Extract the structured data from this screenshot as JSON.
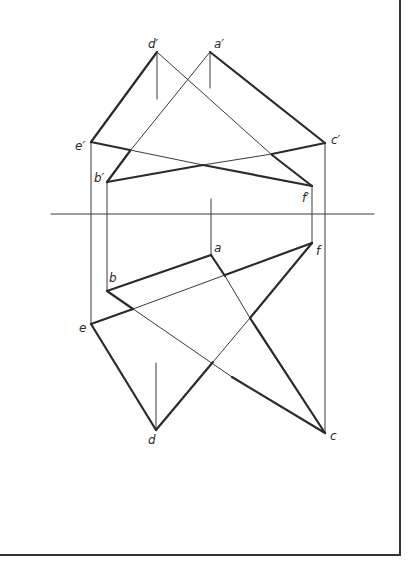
{
  "diagram": {
    "colors": {
      "line": "#2b2b2b",
      "thin": "#3a3a3a",
      "border": "#333333",
      "background": "#ffffff"
    },
    "border": {
      "right_x": 400,
      "bottom_y": 555
    },
    "axis": {
      "x1": 51,
      "x2": 374,
      "y": 214
    },
    "points": {
      "d_prime": {
        "label": "d′",
        "x": 157,
        "y": 52,
        "lx": 148,
        "ly": 38
      },
      "a_prime": {
        "label": "a′",
        "x": 210,
        "y": 52,
        "lx": 214,
        "ly": 38
      },
      "e_prime": {
        "label": "e′",
        "x": 91,
        "y": 142,
        "lx": 75,
        "ly": 140
      },
      "c_prime": {
        "label": "c′",
        "x": 325,
        "y": 143,
        "lx": 331,
        "ly": 134
      },
      "b_prime": {
        "label": "b′",
        "x": 107,
        "y": 182,
        "lx": 94,
        "ly": 172
      },
      "f_prime": {
        "label": "f′",
        "x": 312,
        "y": 186,
        "lx": 302,
        "ly": 192
      },
      "a": {
        "label": "a",
        "x": 211,
        "y": 255,
        "lx": 214,
        "ly": 242
      },
      "f": {
        "label": "f",
        "x": 312,
        "y": 243,
        "lx": 316,
        "ly": 245
      },
      "b": {
        "label": "b",
        "x": 107,
        "y": 291,
        "lx": 109,
        "ly": 272
      },
      "e": {
        "label": "e",
        "x": 91,
        "y": 324,
        "lx": 79,
        "ly": 322
      },
      "d": {
        "label": "d",
        "x": 156,
        "y": 430,
        "lx": 148,
        "ly": 434
      },
      "c": {
        "label": "c",
        "x": 325,
        "y": 433,
        "lx": 330,
        "ly": 430
      }
    },
    "segments": [
      {
        "name": "edge-d'e'",
        "x1": 157,
        "y1": 52,
        "x2": 91,
        "y2": 142,
        "w": 2.2
      },
      {
        "name": "edge-d'f'-thin",
        "x1": 157,
        "y1": 52,
        "x2": 272,
        "y2": 155,
        "w": 1
      },
      {
        "name": "edge-d'f'-thick",
        "x1": 272,
        "y1": 155,
        "x2": 312,
        "y2": 186,
        "w": 2.2
      },
      {
        "name": "edge-e'f'-thick",
        "x1": 91,
        "y1": 142,
        "x2": 130,
        "y2": 150,
        "w": 2.2
      },
      {
        "name": "edge-e'f'-thin",
        "x1": 130,
        "y1": 150,
        "x2": 203,
        "y2": 165,
        "w": 1
      },
      {
        "name": "edge-e'f'-thick2",
        "x1": 203,
        "y1": 165,
        "x2": 312,
        "y2": 186,
        "w": 2.2
      },
      {
        "name": "edge-a'c'",
        "x1": 210,
        "y1": 52,
        "x2": 325,
        "y2": 143,
        "w": 2.2
      },
      {
        "name": "edge-a'b'-thin",
        "x1": 210,
        "y1": 52,
        "x2": 130,
        "y2": 151,
        "w": 1
      },
      {
        "name": "edge-a'b'-thick",
        "x1": 130,
        "y1": 151,
        "x2": 107,
        "y2": 182,
        "w": 2.2
      },
      {
        "name": "edge-b'c'-thick",
        "x1": 107,
        "y1": 182,
        "x2": 203,
        "y2": 165,
        "w": 2.2
      },
      {
        "name": "edge-b'c'-thin",
        "x1": 203,
        "y1": 165,
        "x2": 272,
        "y2": 154,
        "w": 1
      },
      {
        "name": "edge-b'c'-thick2",
        "x1": 272,
        "y1": 154,
        "x2": 325,
        "y2": 143,
        "w": 2.2
      },
      {
        "name": "edge-ab",
        "x1": 211,
        "y1": 255,
        "x2": 107,
        "y2": 291,
        "w": 2.2
      },
      {
        "name": "edge-ac-thick1",
        "x1": 211,
        "y1": 255,
        "x2": 225,
        "y2": 276,
        "w": 2.2
      },
      {
        "name": "edge-ac-thin",
        "x1": 225,
        "y1": 276,
        "x2": 250,
        "y2": 318,
        "w": 1
      },
      {
        "name": "edge-ac-thick2",
        "x1": 250,
        "y1": 318,
        "x2": 325,
        "y2": 433,
        "w": 2.2
      },
      {
        "name": "edge-bc-thin",
        "x1": 107,
        "y1": 291,
        "x2": 232,
        "y2": 377,
        "w": 1
      },
      {
        "name": "edge-bc-thick",
        "x1": 232,
        "y1": 377,
        "x2": 325,
        "y2": 433,
        "w": 2.2
      },
      {
        "name": "edge-bc-thick-start",
        "x1": 107,
        "y1": 291,
        "x2": 133,
        "y2": 309,
        "w": 2.2
      },
      {
        "name": "edge-ef-thick1",
        "x1": 91,
        "y1": 324,
        "x2": 133,
        "y2": 309,
        "w": 2.2
      },
      {
        "name": "edge-ef-thin",
        "x1": 133,
        "y1": 309,
        "x2": 225,
        "y2": 275,
        "w": 1
      },
      {
        "name": "edge-ef-thick2",
        "x1": 225,
        "y1": 275,
        "x2": 312,
        "y2": 243,
        "w": 2.2
      },
      {
        "name": "edge-de",
        "x1": 156,
        "y1": 430,
        "x2": 91,
        "y2": 324,
        "w": 2.2
      },
      {
        "name": "edge-df-thick",
        "x1": 156,
        "y1": 430,
        "x2": 213,
        "y2": 362,
        "w": 2.2
      },
      {
        "name": "edge-df-thin",
        "x1": 213,
        "y1": 362,
        "x2": 250,
        "y2": 318,
        "w": 1
      },
      {
        "name": "edge-df-thick2",
        "x1": 250,
        "y1": 318,
        "x2": 312,
        "y2": 243,
        "w": 2.2
      }
    ],
    "projection_lines": [
      {
        "name": "proj-e",
        "x1": 91,
        "y1": 142,
        "x2": 91,
        "y2": 324
      },
      {
        "name": "proj-b",
        "x1": 107,
        "y1": 182,
        "x2": 107,
        "y2": 291
      },
      {
        "name": "proj-c",
        "x1": 325,
        "y1": 143,
        "x2": 325,
        "y2": 433
      },
      {
        "name": "proj-f",
        "x1": 312,
        "y1": 186,
        "x2": 312,
        "y2": 243
      }
    ],
    "ticks": [
      {
        "name": "tick-d-prime",
        "x1": 157,
        "y1": 52,
        "x2": 157,
        "y2": 99
      },
      {
        "name": "tick-a-prime",
        "x1": 210,
        "y1": 52,
        "x2": 210,
        "y2": 88
      },
      {
        "name": "tick-a",
        "x1": 211,
        "y1": 199,
        "x2": 211,
        "y2": 255
      },
      {
        "name": "tick-d",
        "x1": 156,
        "y1": 363,
        "x2": 156,
        "y2": 430
      }
    ]
  }
}
